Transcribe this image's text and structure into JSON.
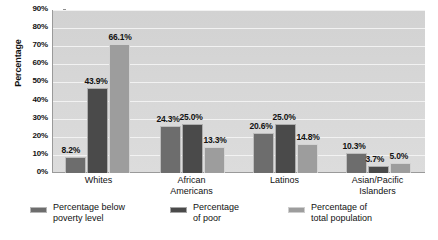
{
  "chart_data": {
    "type": "bar",
    "title": "",
    "xlabel": "",
    "ylabel": "Percentage",
    "ylim": [
      0,
      90
    ],
    "grid": "horizontal",
    "legend_position": "bottom",
    "categories": [
      "Whites",
      "African Americans",
      "Latinos",
      "Asian/Pacific Islanders"
    ],
    "category_lines": [
      [
        "Whites"
      ],
      [
        "African",
        "Americans"
      ],
      [
        "Latinos"
      ],
      [
        "Asian/Pacific",
        "Islanders"
      ]
    ],
    "yticks": [
      "0%",
      "10%",
      "20%",
      "30%",
      "40%",
      "50%",
      "60%",
      "70%",
      "80%",
      "90%"
    ],
    "ytick_values": [
      0,
      10,
      20,
      30,
      40,
      50,
      60,
      70,
      80,
      90
    ],
    "series": [
      {
        "name": "Percentage below poverty level",
        "name_lines": [
          "Percentage below",
          "poverty level"
        ],
        "color": "#6d6d6d",
        "values": [
          8.2,
          24.3,
          20.6,
          10.3
        ],
        "labels": [
          "8.2%",
          "24.3%",
          "20.6%",
          "10.3%"
        ]
      },
      {
        "name": "Percentage of poor",
        "name_lines": [
          "Percentage",
          "of poor"
        ],
        "color": "#4a4a4a",
        "values": [
          43.9,
          25.0,
          25.0,
          3.7
        ],
        "labels": [
          "43.9%",
          "25.0%",
          "25.0%",
          "3.7%"
        ]
      },
      {
        "name": "Percentage of total population",
        "name_lines": [
          "Percentage of",
          "total population"
        ],
        "color": "#9d9d9d",
        "values": [
          66.1,
          13.3,
          14.8,
          5.0
        ],
        "labels": [
          "66.1%",
          "13.3%",
          "14.8%",
          "5.0%"
        ]
      }
    ]
  },
  "colors": {
    "plot_background": "#d6d6d6",
    "gridline": "#f2f2f2",
    "axis": "#9a9a9a",
    "text": "#111111",
    "page_background": "#ffffff"
  }
}
